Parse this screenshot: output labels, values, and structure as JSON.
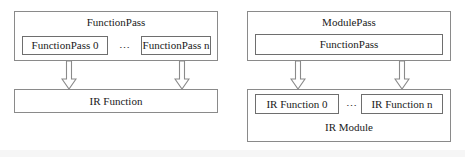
{
  "diagram": {
    "background_color": "#ffffff",
    "border_color": "#808080",
    "text_color": "#1a1a1a",
    "arrow_fill": "#ffffff",
    "arrow_stroke": "#8a8a8a",
    "ellipsis_glyph": "⋯",
    "panels": [
      {
        "id": "function-pass-panel",
        "outer_label": "FunctionPass",
        "inner_boxes": [
          {
            "label": "FunctionPass 0"
          },
          {
            "label": "FunctionPass n"
          }
        ],
        "separator": "⋯",
        "target_box": {
          "label": "IR Function"
        },
        "arrows": 2
      },
      {
        "id": "module-pass-panel",
        "outer_label": "ModulePass",
        "inner_boxes": [
          {
            "label": "FunctionPass"
          }
        ],
        "target_outer_label": "IR Module",
        "target_inner_boxes": [
          {
            "label": "IR Function 0"
          },
          {
            "label": "IR Function n"
          }
        ],
        "separator": "⋯",
        "arrows": 2
      }
    ]
  }
}
